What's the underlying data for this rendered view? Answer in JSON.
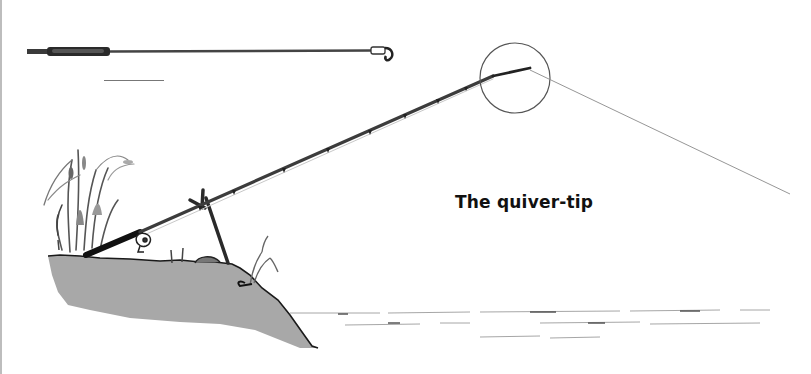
{
  "illustration": {
    "caption": "The quiver-tip",
    "elements": [
      {
        "name": "detached-quiver-tip",
        "icon": "rod-tip-icon"
      },
      {
        "name": "scale-bar",
        "icon": "line"
      },
      {
        "name": "fishing-rod",
        "icon": "rod-icon"
      },
      {
        "name": "magnifier-circle",
        "icon": "circle-icon"
      },
      {
        "name": "fishing-line",
        "icon": "line"
      },
      {
        "name": "rod-rest",
        "icon": "rod-rest-icon"
      },
      {
        "name": "reel",
        "icon": "reel-icon"
      },
      {
        "name": "riverbank",
        "icon": "bank-icon"
      },
      {
        "name": "reeds",
        "icon": "reeds-icon"
      },
      {
        "name": "water-surface",
        "icon": "water-icon"
      }
    ],
    "colors": {
      "bank": "#a8a8a8",
      "ink": "#1a1a1a",
      "line": "#9a9a9a",
      "background": "#ffffff",
      "border": "#bdbdbd"
    }
  }
}
